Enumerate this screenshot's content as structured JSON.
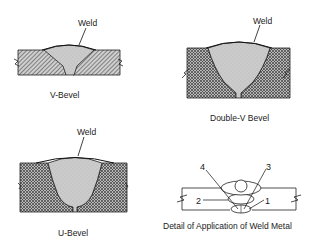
{
  "figure": {
    "panels": [
      {
        "id": "v-bevel",
        "weld_label": "Weld",
        "caption": "V-Bevel"
      },
      {
        "id": "double-v-bevel",
        "weld_label": "Weld",
        "caption": "Double-V Bevel"
      },
      {
        "id": "u-bevel",
        "weld_label": "Weld",
        "caption": "U-Bevel"
      },
      {
        "id": "detail",
        "caption": "Detail of Application of Weld Metal",
        "pass_labels": [
          "1",
          "2",
          "3",
          "4"
        ]
      }
    ]
  },
  "colors": {
    "ink": "#1a1a1a",
    "hatch": "#555555",
    "plate_bg": "#bdbdbd",
    "weld_fill": "#c8c8c8"
  }
}
